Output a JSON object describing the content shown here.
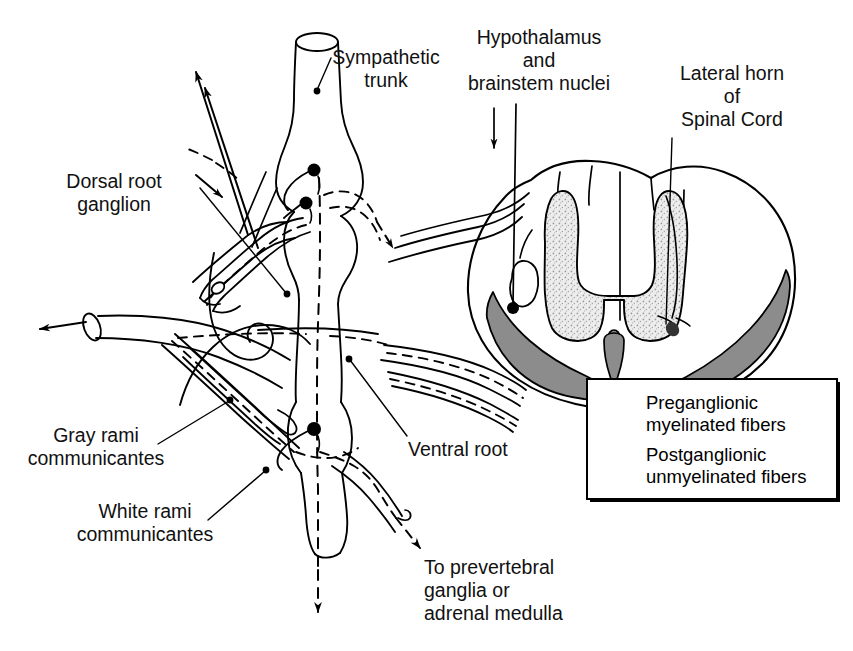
{
  "figure": {
    "background_color": "#ffffff",
    "ink_color": "#000000",
    "gray_matter_color": "#e2e2e2",
    "funiculus_color": "#8c8c8c"
  },
  "labels": {
    "sympathetic_trunk": "Sympathetic\ntrunk",
    "hypothalamus": "Hypothalamus\nand\nbrainstem nuclei",
    "lateral_horn": "Lateral horn\nof\nSpinal Cord",
    "dorsal_root_ganglion": "Dorsal root\nganglion",
    "gray_rami": "Gray rami\ncommunicantes",
    "white_rami": "White rami\ncommunicantes",
    "ventral_root": "Ventral root",
    "to_prevertebral": "To prevertebral\nganglia or\nadrenal medulla"
  },
  "legend": {
    "items": [
      {
        "key": "dashed-line",
        "style": "dashed",
        "label": "Preganglionic\nmyelinated fibers"
      },
      {
        "key": "solid-line",
        "style": "solid",
        "label": "Postganglionic\nunmyelinated fibers"
      }
    ]
  }
}
